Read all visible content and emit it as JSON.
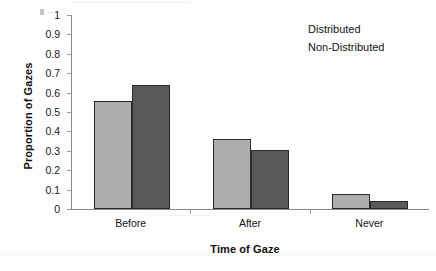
{
  "chart_data": {
    "type": "bar",
    "title": "",
    "subtitle": "",
    "xlabel": "Time of Gaze",
    "ylabel": "Proportion of Gazes",
    "categories": [
      "Before",
      "After",
      "Never"
    ],
    "series": [
      {
        "name": "Distributed",
        "color": "#adadad",
        "values": [
          0.555,
          0.36,
          0.075
        ]
      },
      {
        "name": "Non-Distributed",
        "color": "#595959",
        "values": [
          0.64,
          0.305,
          0.04
        ]
      }
    ],
    "ylim": [
      0,
      1
    ],
    "ytick_step": 0.1,
    "ytick_labels": [
      "1",
      "0.9",
      "0.8",
      "0.7",
      "0.6",
      "0.5",
      "0.4",
      "0.3",
      "0.2",
      "0.1",
      "0"
    ],
    "ytick_values": [
      1,
      0.9,
      0.8,
      0.7,
      0.6,
      0.5,
      0.4,
      0.3,
      0.2,
      0.1,
      0
    ],
    "grid": false,
    "legend_position": "top-right",
    "legend_has_swatches": false,
    "axis_color": "#8a8a8a",
    "bar_outline_color": "#2a2a2a",
    "background": "#fdfdfd"
  },
  "legend": {
    "entries": [
      {
        "label": "Distributed"
      },
      {
        "label": "Non-Distributed"
      }
    ]
  }
}
